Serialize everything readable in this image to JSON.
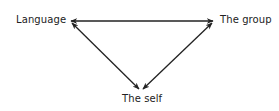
{
  "diagram": {
    "nodes": [
      {
        "id": "language",
        "label": "Language"
      },
      {
        "id": "group",
        "label": "The group"
      },
      {
        "id": "self",
        "label": "The self"
      }
    ],
    "edges": [
      {
        "from": "language",
        "to": "group",
        "type": "bidirectional-arrow"
      },
      {
        "from": "language",
        "to": "self",
        "type": "bidirectional-arrow"
      },
      {
        "from": "group",
        "to": "self",
        "type": "bidirectional-arrow"
      }
    ],
    "colors": {
      "line": "#222222",
      "text": "#222222",
      "background": "#ffffff"
    }
  }
}
